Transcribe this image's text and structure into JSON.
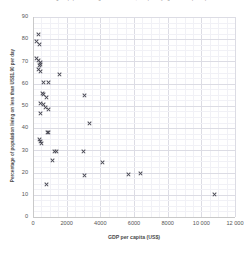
{
  "chart": {
    "title": "Percentage of population living on less than US$1.90 per day against GDP per capita",
    "xlabel": "GDP per capita (US$)",
    "ylabel": "Percentage of population living on less than US$1.90 per day"
  },
  "chart_data": {
    "type": "scatter",
    "title": "Percentage of population living on less than US$1.90 per day against GDP per capita",
    "xlabel": "GDP per capita (US$)",
    "ylabel": "Percentage of population living on less than US$1.90 per day",
    "xlim": [
      0,
      12000
    ],
    "ylim": [
      0,
      90
    ],
    "xticks": [
      0,
      2000,
      4000,
      6000,
      8000,
      10000,
      12000
    ],
    "xtick_labels": [
      "0",
      "2000",
      "4000",
      "6000",
      "8000",
      "10 000",
      "12 000"
    ],
    "yticks": [
      0,
      10,
      20,
      30,
      40,
      50,
      60,
      70,
      80,
      90
    ],
    "ytick_labels": [
      "0",
      "10",
      "20",
      "30",
      "40",
      "50",
      "60",
      "70",
      "80",
      "90"
    ],
    "grid": true,
    "minor_grid": true,
    "legend": false,
    "marker": "x",
    "marker_color": "#4a4a55",
    "points": [
      {
        "x": 330,
        "y": 82.0
      },
      {
        "x": 200,
        "y": 79.0
      },
      {
        "x": 380,
        "y": 77.5
      },
      {
        "x": 180,
        "y": 71.5
      },
      {
        "x": 330,
        "y": 70.5
      },
      {
        "x": 430,
        "y": 69.5
      },
      {
        "x": 470,
        "y": 68.8
      },
      {
        "x": 380,
        "y": 68.0
      },
      {
        "x": 300,
        "y": 66.5
      },
      {
        "x": 440,
        "y": 65.5
      },
      {
        "x": 1560,
        "y": 64.0
      },
      {
        "x": 620,
        "y": 60.5
      },
      {
        "x": 900,
        "y": 60.5
      },
      {
        "x": 580,
        "y": 55.5
      },
      {
        "x": 620,
        "y": 55.0
      },
      {
        "x": 780,
        "y": 54.0
      },
      {
        "x": 3050,
        "y": 54.5
      },
      {
        "x": 430,
        "y": 51.0
      },
      {
        "x": 600,
        "y": 50.5
      },
      {
        "x": 760,
        "y": 49.5
      },
      {
        "x": 900,
        "y": 48.5
      },
      {
        "x": 450,
        "y": 46.5
      },
      {
        "x": 3340,
        "y": 42.0
      },
      {
        "x": 880,
        "y": 38.0
      },
      {
        "x": 950,
        "y": 38.2
      },
      {
        "x": 380,
        "y": 35.0
      },
      {
        "x": 420,
        "y": 34.0
      },
      {
        "x": 520,
        "y": 33.0
      },
      {
        "x": 1250,
        "y": 29.5
      },
      {
        "x": 1400,
        "y": 29.5
      },
      {
        "x": 3000,
        "y": 29.5
      },
      {
        "x": 1180,
        "y": 25.5
      },
      {
        "x": 4120,
        "y": 24.5
      },
      {
        "x": 3080,
        "y": 18.5
      },
      {
        "x": 5700,
        "y": 19.0
      },
      {
        "x": 6400,
        "y": 19.5
      },
      {
        "x": 780,
        "y": 14.5
      },
      {
        "x": 10800,
        "y": 10.0
      }
    ]
  }
}
